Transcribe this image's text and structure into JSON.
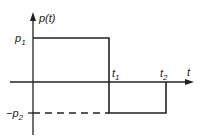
{
  "diagram": {
    "y_axis_label": "p(t)",
    "x_axis_label": "t",
    "levels": {
      "high": "p1",
      "low": "-p2"
    },
    "times": {
      "t1": "t1",
      "t2": "t2"
    },
    "labels": {
      "p_high": "p",
      "p_high_sub": "1",
      "p_low": "−p",
      "p_low_sub": "2",
      "t1": "t",
      "t1_sub": "1",
      "t2": "t",
      "t2_sub": "2"
    }
  }
}
